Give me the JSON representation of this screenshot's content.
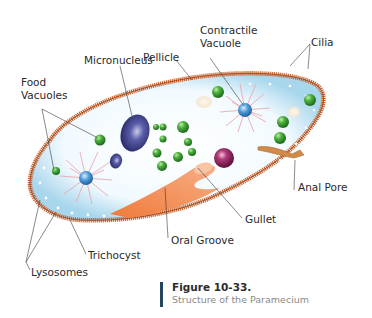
{
  "figure": {
    "number": "Figure 10-33.",
    "title": "Structure of the Paramecium"
  },
  "labels": {
    "pellicle": "Pellicle",
    "contractile_vacuole": "Contractile\nVacuole",
    "cilia": "Cilia",
    "micronucleus": "Micronucleus",
    "food_vacuoles": "Food\nVacuoles",
    "anal_pore": "Anal Pore",
    "gullet": "Gullet",
    "oral_groove": "Oral Groove",
    "trichocyst": "Trichocyst",
    "lysosomes": "Lysosomes"
  },
  "colors": {
    "membrane": "#c8642e",
    "cytoplasm": "#f4fbff",
    "cytoplasm_edge": "#a9d8ee",
    "food_vacuole": "#3e9a32",
    "micronucleus": "#2f3378",
    "macronucleus": "#8a1f5a",
    "oral_groove": "#f0915a",
    "contractile_vacuole": "#4a90d0",
    "contractile_rays": "#e8a0a8",
    "caption_bar": "#24465e"
  }
}
